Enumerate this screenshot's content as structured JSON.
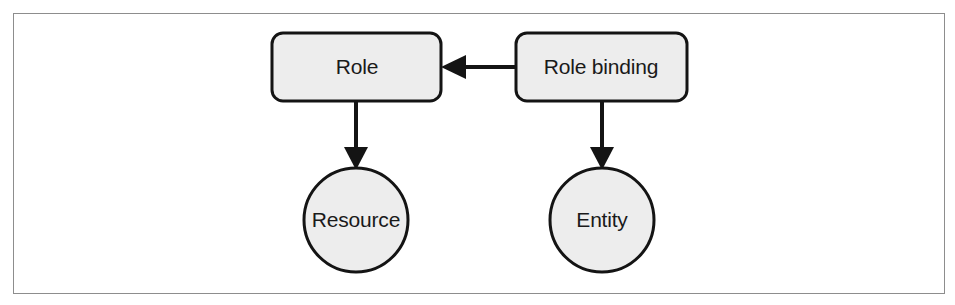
{
  "figure": {
    "type": "diagram",
    "background_color": "#ffffff",
    "frame_color": "#8d8d8d",
    "node_fill_color": "#ededed",
    "node_stroke_color": "#141414",
    "label_color": "#1a1a1a"
  },
  "nodes": {
    "role": {
      "label": "Role",
      "shape": "rounded-rectangle",
      "x": 272,
      "y": 33,
      "width": 169,
      "height": 68,
      "corner_radius": 11
    },
    "role_binding": {
      "label": "Role binding",
      "shape": "rounded-rectangle",
      "x": 516,
      "y": 33,
      "width": 171,
      "height": 68,
      "corner_radius": 11
    },
    "resource": {
      "label": "Resource",
      "shape": "circle",
      "cx": 356,
      "cy": 220,
      "r": 52
    },
    "entity": {
      "label": "Entity",
      "shape": "circle",
      "cx": 602,
      "cy": 220,
      "r": 52
    }
  },
  "edges": [
    {
      "name": "role-binding-to-role",
      "from": "role_binding",
      "to": "role",
      "direction": "left",
      "style": "solid-filled-arrow"
    },
    {
      "name": "role-to-resource",
      "from": "role",
      "to": "resource",
      "direction": "down",
      "style": "solid-filled-arrow"
    },
    {
      "name": "role-binding-to-entity",
      "from": "role_binding",
      "to": "entity",
      "direction": "down",
      "style": "solid-filled-arrow"
    }
  ]
}
